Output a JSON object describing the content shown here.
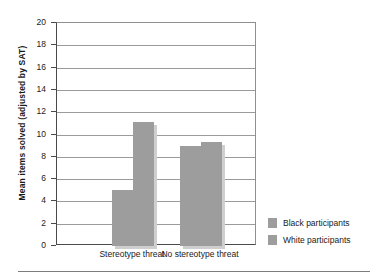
{
  "chart_data": {
    "type": "bar",
    "title": "",
    "subtitle": "",
    "xlabel": "",
    "ylabel": "Mean items solved (adjusted by SAT)",
    "categories": [
      "Stereotype threat",
      "No stereotype threat"
    ],
    "series": [
      {
        "name": "Black participants",
        "values": [
          5.0,
          9.0
        ],
        "color": "#9d9d9d"
      },
      {
        "name": "White participants",
        "values": [
          11.1,
          9.3
        ],
        "color": "#9d9d9d"
      }
    ],
    "ylim": [
      0,
      20
    ],
    "y_ticks": [
      0,
      2,
      4,
      6,
      8,
      10,
      12,
      14,
      16,
      18,
      20
    ],
    "y_tick_labels": [
      "0",
      "2",
      "4",
      "6",
      "8",
      "10",
      "12",
      "14",
      "16",
      "18",
      "20"
    ],
    "grid": true,
    "grid_axis": "y",
    "legend_position": "right"
  },
  "axis": {
    "y_title": "Mean items solved (adjusted by SAT)",
    "ticks": [
      {
        "value": 20,
        "label": "20"
      },
      {
        "value": 18,
        "label": "18"
      },
      {
        "value": 16,
        "label": "16"
      },
      {
        "value": 14,
        "label": "14"
      },
      {
        "value": 12,
        "label": "12"
      },
      {
        "value": 10,
        "label": "10"
      },
      {
        "value": 8,
        "label": "8"
      },
      {
        "value": 6,
        "label": "6"
      },
      {
        "value": 4,
        "label": "4"
      },
      {
        "value": 2,
        "label": "2"
      },
      {
        "value": 0,
        "label": "0"
      }
    ]
  },
  "groups": [
    {
      "label": "Stereotype threat",
      "black": 5.0,
      "white": 11.1
    },
    {
      "label": "No stereotype threat",
      "black": 9.0,
      "white": 9.3
    }
  ],
  "legend": {
    "items": [
      {
        "label": "Black participants",
        "color": "#9d9d9d"
      },
      {
        "label": "White participants",
        "color": "#9d9d9d"
      }
    ]
  },
  "colors": {
    "bar": "#9d9d9d",
    "bar_shadow": "#cfcfcf",
    "grid": "#9b9b9b",
    "axis": "#4a4a4a",
    "text": "#1a1a1a",
    "rule": "#7d7d7d",
    "background": "#ffffff"
  }
}
